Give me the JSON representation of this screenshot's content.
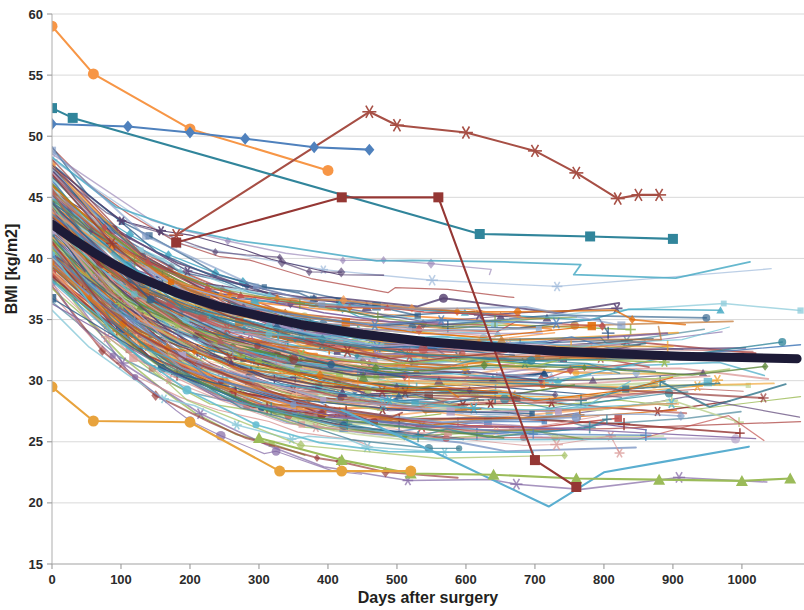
{
  "chart_data": {
    "type": "line",
    "title": "",
    "subtitle": "",
    "xlabel": "Days after surgery",
    "ylabel": "BMI [kg/m2]",
    "xlim": [
      0,
      1090
    ],
    "ylim": [
      15,
      60
    ],
    "xticks": [
      0,
      100,
      200,
      300,
      400,
      500,
      600,
      700,
      800,
      900,
      1000
    ],
    "yticks": [
      15,
      20,
      25,
      30,
      35,
      40,
      45,
      50,
      55,
      60
    ],
    "xtick_labels": [
      "0",
      "100",
      "200",
      "300",
      "400",
      "500",
      "600",
      "700",
      "800",
      "900",
      "1000"
    ],
    "ytick_labels": [
      "15",
      "20",
      "25",
      "30",
      "35",
      "40",
      "45",
      "50",
      "55",
      "60"
    ],
    "grid": "horizontal",
    "legend": "none",
    "palette": [
      "#4f81bd",
      "#f79646",
      "#9bbb59",
      "#8064a2",
      "#4bacc6",
      "#c0504d",
      "#95b3d7",
      "#fac090",
      "#c3d69b",
      "#b3a2c7",
      "#92cddc",
      "#d99694",
      "#1f497d",
      "#e36c09",
      "#76933c",
      "#60497a",
      "#31859b",
      "#953734",
      "#7f99c6",
      "#f0a22e",
      "#a9c46c",
      "#9a86b8",
      "#65bed1",
      "#b8605d",
      "#2e5f8a",
      "#c0722c",
      "#5f8a3c",
      "#554170",
      "#3f7f94",
      "#7e4340"
    ],
    "mean_series": {
      "name": "Mean BMI",
      "color": "#1d1b37",
      "linewidth": 9,
      "x": [
        0,
        30,
        60,
        90,
        120,
        180,
        240,
        300,
        360,
        450,
        540,
        630,
        730,
        820,
        910,
        1000,
        1080
      ],
      "y": [
        42.8,
        41.6,
        40.5,
        39.5,
        38.6,
        37.2,
        36.1,
        35.3,
        34.6,
        33.8,
        33.2,
        32.8,
        32.4,
        32.2,
        32.0,
        31.9,
        31.8
      ]
    },
    "highlight_series": [
      {
        "name": "patient-high-orange",
        "color": "#f79646",
        "marker": "circle",
        "x": [
          0,
          60,
          200,
          400
        ],
        "y": [
          59.0,
          55.1,
          50.6,
          47.2
        ]
      },
      {
        "name": "patient-asterisk-darkred",
        "color": "#a74f45",
        "marker": "asterisk",
        "x": [
          180,
          460,
          500,
          600,
          700,
          760,
          820,
          850,
          880
        ],
        "y": [
          41.9,
          52.0,
          50.9,
          50.3,
          48.8,
          47.0,
          44.9,
          45.2,
          45.2
        ]
      },
      {
        "name": "patient-diamond-blue",
        "color": "#4f81bd",
        "marker": "diamond",
        "x": [
          0,
          110,
          200,
          280,
          380,
          460
        ],
        "y": [
          51.0,
          50.8,
          50.3,
          49.8,
          49.1,
          48.9
        ]
      },
      {
        "name": "patient-square-teal",
        "color": "#31859b",
        "marker": "square",
        "x": [
          0,
          30,
          620,
          780,
          900
        ],
        "y": [
          52.3,
          51.5,
          42.0,
          41.8,
          41.6
        ]
      },
      {
        "name": "patient-low-lightblue",
        "color": "#5aaed0",
        "marker": "none",
        "x": [
          420,
          560,
          720,
          800,
          900,
          1010
        ],
        "y": [
          27.6,
          24.0,
          19.7,
          22.5,
          23.5,
          24.6
        ]
      },
      {
        "name": "patient-low-green",
        "color": "#9bbb59",
        "marker": "triangle",
        "x": [
          300,
          420,
          520,
          640,
          760,
          880,
          1000,
          1070
        ],
        "y": [
          25.3,
          23.5,
          22.4,
          22.3,
          22.0,
          21.9,
          21.8,
          22.0
        ]
      },
      {
        "name": "patient-flat-orange-low",
        "color": "#e8a33d",
        "marker": "circle",
        "x": [
          0,
          60,
          200,
          330,
          420,
          520
        ],
        "y": [
          29.5,
          26.7,
          26.6,
          22.6,
          22.6,
          22.6
        ]
      },
      {
        "name": "patient-rise-brown",
        "color": "#953734",
        "marker": "square",
        "x": [
          180,
          420,
          560,
          700,
          760
        ],
        "y": [
          41.3,
          45.0,
          45.0,
          23.5,
          21.3
        ]
      }
    ]
  },
  "axes": {
    "x_axis_name": "x-axis",
    "y_axis_name": "y-axis"
  }
}
